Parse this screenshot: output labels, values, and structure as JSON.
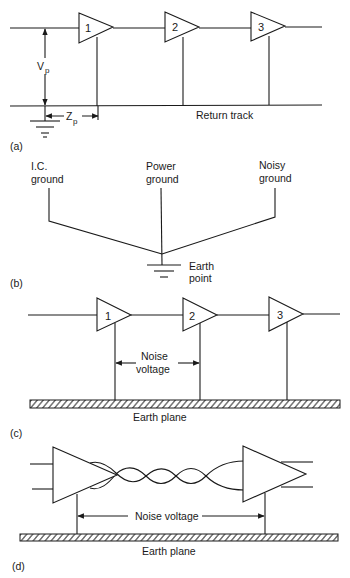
{
  "figure": {
    "panels": [
      {
        "id": "a",
        "caption": "(a)",
        "amplifiers": [
          "1",
          "2",
          "3"
        ],
        "labels": {
          "vp_main": "V",
          "vp_sub": "p",
          "zp_main": "Z",
          "zp_sub": "p",
          "return_track": "Return track"
        }
      },
      {
        "id": "b",
        "caption": "(b)",
        "grounds": [
          {
            "line1": "I.C.",
            "line2": "ground"
          },
          {
            "line1": "Power",
            "line2": "ground"
          },
          {
            "line1": "Noisy",
            "line2": "ground"
          }
        ],
        "earth_label": {
          "line1": "Earth",
          "line2": "point"
        }
      },
      {
        "id": "c",
        "caption": "(c)",
        "amplifiers": [
          "1",
          "2",
          "3"
        ],
        "noise_label": {
          "line1": "Noise",
          "line2": "voltage"
        },
        "plane_label": "Earth plane"
      },
      {
        "id": "d",
        "caption": "(d)",
        "noise_label": "Noise voltage",
        "plane_label": "Earth plane"
      }
    ],
    "colors": {
      "ink": "#1a1a1a",
      "background": "#ffffff"
    }
  }
}
